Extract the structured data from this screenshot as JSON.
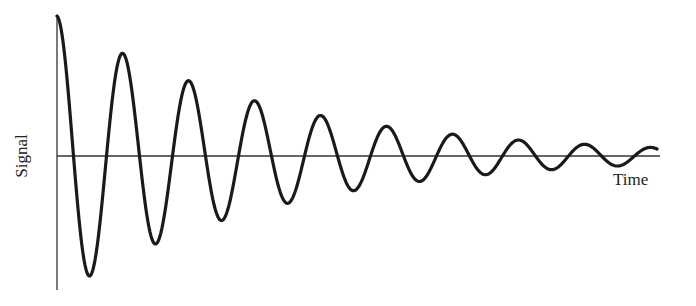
{
  "chart_data": {
    "type": "line",
    "title": "",
    "xlabel": "Time",
    "ylabel": "Signal",
    "grid": false,
    "legend": null,
    "series": [
      {
        "name": "Signal",
        "function": "A0 * exp(-k t) * cos(2 pi t / T)",
        "extrema": [
          {
            "t": 0.0,
            "value": 1.0
          },
          {
            "t": 0.5,
            "value": -0.81
          },
          {
            "t": 1.0,
            "value": 0.74
          },
          {
            "t": 1.5,
            "value": -0.59
          },
          {
            "t": 2.0,
            "value": 0.54
          },
          {
            "t": 2.5,
            "value": -0.42
          },
          {
            "t": 3.0,
            "value": 0.4
          },
          {
            "t": 3.5,
            "value": -0.3
          },
          {
            "t": 4.0,
            "value": 0.29
          },
          {
            "t": 4.5,
            "value": -0.21
          },
          {
            "t": 5.0,
            "value": 0.21
          },
          {
            "t": 5.5,
            "value": -0.15
          },
          {
            "t": 6.0,
            "value": 0.16
          },
          {
            "t": 6.5,
            "value": -0.11
          },
          {
            "t": 7.0,
            "value": 0.11
          },
          {
            "t": 7.5,
            "value": -0.07
          },
          {
            "t": 8.0,
            "value": 0.08
          },
          {
            "t": 8.5,
            "value": -0.05
          },
          {
            "t": 9.0,
            "value": 0.05
          }
        ]
      }
    ],
    "xlim": [
      0,
      9.1
    ],
    "ylim": [
      -1,
      1
    ],
    "tick_labels": []
  },
  "colors": {
    "line": "#1a1a1a",
    "axis": "#333333",
    "background": "#ffffff"
  },
  "geometry": {
    "x0": 57,
    "y0": 156,
    "period_px": 66,
    "amp0_px": 140,
    "decay": 0.31,
    "x_end": 657
  }
}
